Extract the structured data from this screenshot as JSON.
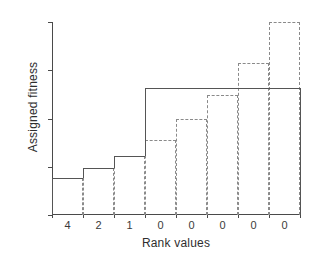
{
  "chart_data": {
    "type": "bar",
    "title": "",
    "xlabel": "Rank values",
    "ylabel": "Assigned fitness",
    "categories": [
      "4",
      "2",
      "1",
      "0",
      "0",
      "0",
      "0",
      "0"
    ],
    "xtick_labels": [
      "4",
      "2",
      "1",
      "0",
      "0",
      "0",
      "0",
      "0"
    ],
    "ytick_labels": [
      "0",
      "0.5",
      "1",
      "1.5",
      "2"
    ],
    "ytick_values": [
      0,
      0.5,
      1,
      1.5,
      2
    ],
    "ylim": [
      0,
      2
    ],
    "grid": false,
    "legend": "none",
    "series": [
      {
        "name": "step-solid",
        "style": "solid-step",
        "values": [
          0.38,
          0.49,
          0.61,
          1.32,
          1.32,
          1.32,
          1.32,
          1.32
        ]
      },
      {
        "name": "bars-dashed",
        "style": "dashed-bar",
        "values": [
          0.38,
          0.49,
          0.61,
          0.78,
          0.99,
          1.24,
          1.57,
          2.0
        ]
      }
    ]
  },
  "colors": {
    "axis": "#4a4a4a",
    "solid_series": "#555555",
    "dashed_series": "#8a8a8a",
    "background": "#ffffff",
    "text": "#2e2e2e"
  }
}
